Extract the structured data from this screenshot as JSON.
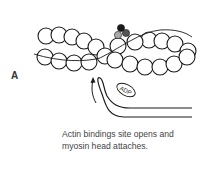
{
  "panel": {
    "label": "A",
    "caption_line1": "Actin bindings site opens and",
    "caption_line2": "myosin head attaches.",
    "adp_label": "ADP"
  },
  "colors": {
    "stroke": "#1a1a1a",
    "bead_fill": "#ffffff",
    "troponin_dark": "#1a1a1a",
    "troponin_mid": "#555555",
    "troponin_light": "#aaaaaa",
    "text": "#444444"
  }
}
